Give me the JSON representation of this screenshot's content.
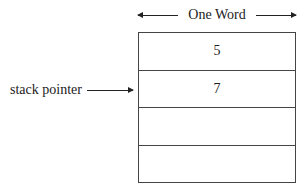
{
  "diagram": {
    "width_label": "One Word",
    "pointer_label": "stack pointer",
    "pointer_row_index": 1,
    "cells": [
      {
        "value": "5"
      },
      {
        "value": "7"
      },
      {
        "value": ""
      },
      {
        "value": ""
      }
    ]
  }
}
